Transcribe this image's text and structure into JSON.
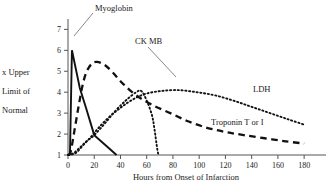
{
  "chart_data": {
    "type": "line",
    "title": "",
    "xlabel": "Hours from Onset of Infarction",
    "ylabel": "x Upper Limit of Normal",
    "ylabel_lines": [
      "x Upper",
      "Limit of",
      "Normal"
    ],
    "xlim": [
      0,
      186
    ],
    "ylim": [
      1,
      7.4
    ],
    "xticks": [
      0,
      20,
      40,
      60,
      80,
      100,
      120,
      140,
      160,
      180
    ],
    "xtick_labels": [
      "0",
      "20",
      "40",
      "60",
      "80",
      "100",
      "120",
      "140",
      "160",
      "180"
    ],
    "yticks": [
      1,
      2,
      3,
      4,
      5,
      6,
      7
    ],
    "ytick_labels": [
      "1",
      "2",
      "3",
      "4",
      "5",
      "6",
      "7"
    ],
    "grid": false,
    "legend_position": "inline-annotations",
    "series": [
      {
        "name": "Myoglobin",
        "style": "solid",
        "label": "Myoglobin",
        "points": [
          [
            0,
            1.0
          ],
          [
            1.5,
            1.05
          ],
          [
            3,
            6.0
          ],
          [
            9,
            4.2
          ],
          [
            14,
            3.2
          ],
          [
            20,
            1.95
          ],
          [
            28,
            1.5
          ],
          [
            37,
            1.0
          ]
        ]
      },
      {
        "name": "CK MB",
        "style": "dotted",
        "label": "CK MB",
        "points": [
          [
            0,
            1.0
          ],
          [
            4,
            1.08
          ],
          [
            9,
            1.35
          ],
          [
            14,
            1.65
          ],
          [
            20,
            1.95
          ],
          [
            28,
            2.5
          ],
          [
            36,
            3.1
          ],
          [
            44,
            3.6
          ],
          [
            52,
            4.0
          ],
          [
            56,
            4.05
          ],
          [
            60,
            3.6
          ],
          [
            64,
            2.9
          ],
          [
            66,
            2.2
          ],
          [
            68,
            1.3
          ],
          [
            69,
            1.0
          ]
        ]
      },
      {
        "name": "Troponin T or I",
        "style": "dashed",
        "label": "Troponin T or I",
        "points": [
          [
            0,
            1.0
          ],
          [
            2,
            1.15
          ],
          [
            5,
            2.2
          ],
          [
            8,
            3.3
          ],
          [
            11,
            4.3
          ],
          [
            14,
            4.95
          ],
          [
            18,
            5.35
          ],
          [
            22,
            5.45
          ],
          [
            28,
            5.3
          ],
          [
            34,
            4.95
          ],
          [
            42,
            4.4
          ],
          [
            52,
            3.85
          ],
          [
            64,
            3.4
          ],
          [
            78,
            3.0
          ],
          [
            92,
            2.6
          ],
          [
            106,
            2.3
          ],
          [
            120,
            2.1
          ],
          [
            134,
            1.95
          ],
          [
            150,
            1.8
          ],
          [
            166,
            1.65
          ],
          [
            180,
            1.55
          ]
        ]
      },
      {
        "name": "LDH",
        "style": "dotted",
        "label": "LDH",
        "points": [
          [
            0,
            1.0
          ],
          [
            6,
            1.1
          ],
          [
            12,
            1.5
          ],
          [
            18,
            1.9
          ],
          [
            24,
            2.35
          ],
          [
            32,
            2.85
          ],
          [
            40,
            3.25
          ],
          [
            48,
            3.6
          ],
          [
            58,
            3.9
          ],
          [
            70,
            4.05
          ],
          [
            84,
            4.1
          ],
          [
            98,
            4.0
          ],
          [
            112,
            3.85
          ],
          [
            126,
            3.6
          ],
          [
            140,
            3.3
          ],
          [
            154,
            3.0
          ],
          [
            168,
            2.7
          ],
          [
            180,
            2.45
          ]
        ]
      }
    ],
    "annotations": [
      {
        "name": "Myoglobin",
        "text": "Myoglobin",
        "text_x": 95,
        "text_y": 11,
        "leader": [
          [
            93,
            13
          ],
          [
            74,
            36
          ]
        ]
      },
      {
        "name": "CK MB",
        "text": "CK MB",
        "text_x": 135,
        "text_y": 44,
        "leader": [
          [
            148,
            47
          ],
          [
            176,
            77
          ]
        ]
      },
      {
        "name": "LDH",
        "text": "LDH",
        "text_x": 253,
        "text_y": 92,
        "leader": []
      },
      {
        "name": "Troponin T or I",
        "text": "Troponin T or I",
        "text_x": 211,
        "text_y": 125,
        "leader": []
      }
    ]
  }
}
